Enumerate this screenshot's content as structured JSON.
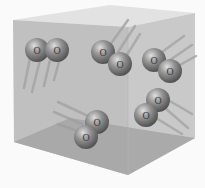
{
  "diagram": {
    "container": "cube",
    "molecule_label": "O",
    "molecules": [
      {
        "atoms": [
          {
            "x": 37,
            "y": 50,
            "label": "O"
          },
          {
            "x": 57,
            "y": 50,
            "label": "O"
          }
        ],
        "motion": "down-left"
      },
      {
        "atoms": [
          {
            "x": 103,
            "y": 52,
            "label": "O"
          },
          {
            "x": 120,
            "y": 64,
            "label": "O"
          }
        ],
        "motion": "up-right"
      },
      {
        "atoms": [
          {
            "x": 154,
            "y": 60,
            "label": "O"
          },
          {
            "x": 170,
            "y": 71,
            "label": "O"
          }
        ],
        "motion": "up-right"
      },
      {
        "atoms": [
          {
            "x": 97,
            "y": 122,
            "label": "O"
          },
          {
            "x": 86,
            "y": 137,
            "label": "O"
          }
        ],
        "motion": "up-left"
      },
      {
        "atoms": [
          {
            "x": 158,
            "y": 100,
            "label": "O"
          },
          {
            "x": 146,
            "y": 115,
            "label": "O"
          }
        ],
        "motion": "down-right"
      }
    ],
    "colors": {
      "background": "#fafafa",
      "box_front": "#bdbdbd",
      "box_side": "#c8c8c8",
      "box_top": "#dedede",
      "box_floor": "#a9a9a9",
      "atom": "#6e6e6e"
    }
  }
}
